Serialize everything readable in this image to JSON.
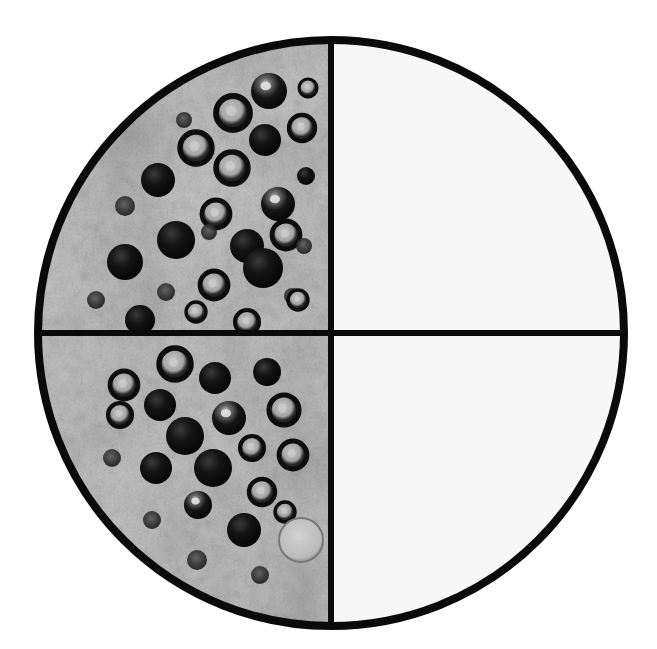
{
  "figure": {
    "kind": "micrograph",
    "title": "Circular microscope field of view with crosshair reticle",
    "description": "Grayscale transmission micrograph of tissue occupying the left half of a round field; dark spherical vesicles scattered through a granular cytoplasmic matrix. The right half of the field is blank.",
    "background_color": "#ffffff",
    "blank_region_color": "#f7f7f7",
    "outline_color": "#0a0a0a",
    "reticle_color": "#0a0a0a"
  },
  "field": {
    "center_x": 331,
    "center_y": 333,
    "radius": 297,
    "outline_width": 8,
    "reticle_width": 6,
    "reticle_orientation": "vertical-and-horizontal",
    "vertical_line_x": 331,
    "horizontal_line_y": 333
  },
  "quadrants": [
    {
      "id": "upper-left",
      "label": "Quadrant I (upper-left)",
      "content": "specimen",
      "fill": "tissue-texture",
      "vesicle_count": 34,
      "mean_gray": "#b4b4b4"
    },
    {
      "id": "upper-right",
      "label": "Quadrant II (upper-right)",
      "content": "blank",
      "fill": "#f7f7f7",
      "vesicle_count": 0,
      "mean_gray": "#f7f7f7"
    },
    {
      "id": "lower-left",
      "label": "Quadrant III (lower-left)",
      "content": "specimen",
      "fill": "tissue-texture",
      "vesicle_count": 31,
      "mean_gray": "#b0b0b0"
    },
    {
      "id": "lower-right",
      "label": "Quadrant IV (lower-right)",
      "content": "blank",
      "fill": "#f7f7f7",
      "vesicle_count": 0,
      "mean_gray": "#f7f7f7"
    }
  ],
  "chart_data": {
    "type": "scatter",
    "title": "Circular microscope field of view with crosshair reticle",
    "xlabel": "",
    "ylabel": "",
    "xlim": [
      34,
      628
    ],
    "ylim": [
      36,
      630
    ],
    "grid": false,
    "legend": "none",
    "annotations": [
      "Specimen confined to left half of circular field",
      "Right half of field is empty / unstained",
      "Crosshair reticle divides field into four equal quadrants"
    ],
    "categories": [
      "upper-left",
      "upper-right",
      "lower-left",
      "lower-right"
    ],
    "values": [
      34,
      0,
      31,
      0
    ],
    "series": [
      {
        "name": "vesicles-per-quadrant",
        "values": [
          34,
          0,
          31,
          0
        ]
      }
    ],
    "vesicles": [
      {
        "x": 269,
        "y": 91,
        "r": 18,
        "style": "filled-highlight"
      },
      {
        "x": 308,
        "y": 88,
        "r": 9,
        "style": "ring"
      },
      {
        "x": 233,
        "y": 113,
        "r": 17,
        "style": "ring"
      },
      {
        "x": 302,
        "y": 128,
        "r": 13,
        "style": "ring"
      },
      {
        "x": 265,
        "y": 140,
        "r": 16,
        "style": "filled"
      },
      {
        "x": 196,
        "y": 148,
        "r": 16,
        "style": "ring"
      },
      {
        "x": 306,
        "y": 176,
        "r": 9,
        "style": "filled"
      },
      {
        "x": 232,
        "y": 168,
        "r": 16,
        "style": "ring"
      },
      {
        "x": 158,
        "y": 180,
        "r": 17,
        "style": "filled"
      },
      {
        "x": 278,
        "y": 204,
        "r": 17,
        "style": "filled-highlight"
      },
      {
        "x": 216,
        "y": 214,
        "r": 14,
        "style": "ring"
      },
      {
        "x": 184,
        "y": 120,
        "r": 8,
        "style": "speck"
      },
      {
        "x": 247,
        "y": 246,
        "r": 17,
        "style": "filled"
      },
      {
        "x": 209,
        "y": 232,
        "r": 8,
        "style": "speck"
      },
      {
        "x": 176,
        "y": 240,
        "r": 19,
        "style": "filled"
      },
      {
        "x": 286,
        "y": 235,
        "r": 14,
        "style": "ring"
      },
      {
        "x": 125,
        "y": 262,
        "r": 18,
        "style": "filled"
      },
      {
        "x": 263,
        "y": 268,
        "r": 20,
        "style": "filled"
      },
      {
        "x": 214,
        "y": 285,
        "r": 14,
        "style": "ring"
      },
      {
        "x": 166,
        "y": 292,
        "r": 9,
        "style": "speck"
      },
      {
        "x": 292,
        "y": 296,
        "r": 8,
        "style": "speck"
      },
      {
        "x": 140,
        "y": 320,
        "r": 15,
        "style": "filled"
      },
      {
        "x": 196,
        "y": 312,
        "r": 10,
        "style": "ring"
      },
      {
        "x": 247,
        "y": 322,
        "r": 12,
        "style": "ring"
      },
      {
        "x": 304,
        "y": 246,
        "r": 8,
        "style": "speck"
      },
      {
        "x": 125,
        "y": 206,
        "r": 10,
        "style": "speck"
      },
      {
        "x": 96,
        "y": 300,
        "r": 9,
        "style": "speck"
      },
      {
        "x": 298,
        "y": 300,
        "r": 10,
        "style": "ring"
      },
      {
        "x": 215,
        "y": 378,
        "r": 16,
        "style": "filled"
      },
      {
        "x": 175,
        "y": 364,
        "r": 16,
        "style": "ring"
      },
      {
        "x": 267,
        "y": 372,
        "r": 14,
        "style": "filled"
      },
      {
        "x": 124,
        "y": 385,
        "r": 14,
        "style": "ring"
      },
      {
        "x": 160,
        "y": 405,
        "r": 16,
        "style": "filled"
      },
      {
        "x": 120,
        "y": 415,
        "r": 12,
        "style": "ring"
      },
      {
        "x": 229,
        "y": 418,
        "r": 17,
        "style": "filled-highlight"
      },
      {
        "x": 284,
        "y": 410,
        "r": 15,
        "style": "ring"
      },
      {
        "x": 185,
        "y": 436,
        "r": 19,
        "style": "filled"
      },
      {
        "x": 252,
        "y": 448,
        "r": 12,
        "style": "ring"
      },
      {
        "x": 293,
        "y": 455,
        "r": 14,
        "style": "ring"
      },
      {
        "x": 156,
        "y": 468,
        "r": 16,
        "style": "filled"
      },
      {
        "x": 213,
        "y": 468,
        "r": 19,
        "style": "filled"
      },
      {
        "x": 262,
        "y": 492,
        "r": 13,
        "style": "ring"
      },
      {
        "x": 198,
        "y": 505,
        "r": 14,
        "style": "filled-highlight"
      },
      {
        "x": 285,
        "y": 512,
        "r": 10,
        "style": "ring"
      },
      {
        "x": 244,
        "y": 530,
        "r": 17,
        "style": "filled"
      },
      {
        "x": 152,
        "y": 520,
        "r": 9,
        "style": "speck"
      },
      {
        "x": 112,
        "y": 458,
        "r": 9,
        "style": "speck"
      },
      {
        "x": 301,
        "y": 540,
        "r": 22,
        "style": "pale-cell"
      },
      {
        "x": 197,
        "y": 560,
        "r": 10,
        "style": "speck"
      },
      {
        "x": 260,
        "y": 575,
        "r": 9,
        "style": "speck"
      }
    ]
  }
}
